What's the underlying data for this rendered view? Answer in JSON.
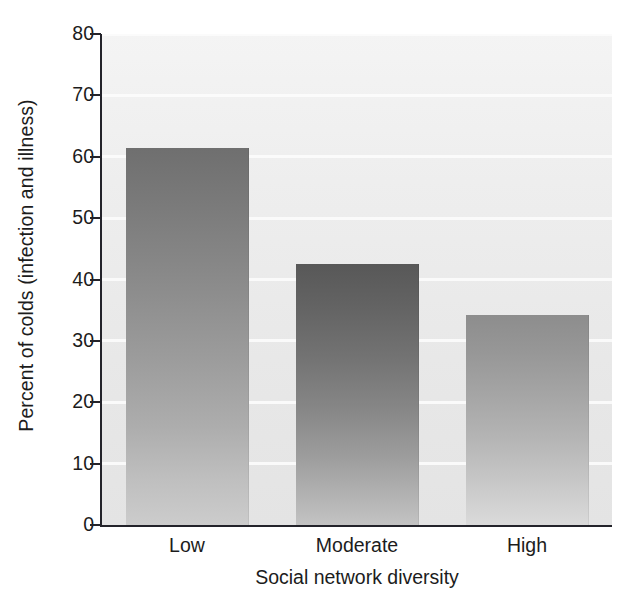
{
  "chart_data": {
    "type": "bar",
    "title": "",
    "subtitle": "",
    "xlabel": "Social network diversity",
    "ylabel": "Percent of colds (infection and illness)",
    "categories": [
      "Low",
      "Moderate",
      "High"
    ],
    "values": [
      61.4,
      42.5,
      34.2
    ],
    "series": [
      {
        "name": "Percent of colds",
        "values": [
          61.4,
          42.5,
          34.2
        ]
      }
    ],
    "ylim": [
      0,
      80
    ],
    "yticks": [
      0,
      10,
      20,
      30,
      40,
      50,
      60,
      70,
      80
    ],
    "ytick_labels": [
      "0",
      "10",
      "20",
      "30",
      "40",
      "50",
      "60",
      "70",
      "80"
    ],
    "grid": true,
    "grid_axis": "y",
    "grid_color": "#fbfbfb",
    "legend": false,
    "legend_position": "none",
    "bar_colors": [
      "#8b8b8b",
      "#737373",
      "#a5a5a5"
    ],
    "background_color": "#ececec",
    "axis_color": "#23232a"
  },
  "axes": {
    "y_title": "Percent of colds (infection and illness)",
    "x_title": "Social network diversity"
  }
}
